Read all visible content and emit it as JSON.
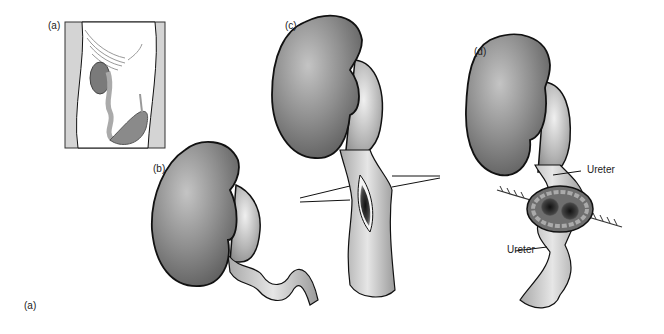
{
  "figure": {
    "panels": [
      {
        "id": "a",
        "label": "(a)",
        "description": "Body inset showing kidney and ureter position"
      },
      {
        "id": "b",
        "label": "(b)",
        "description": "Kidney with tortuous ureter"
      },
      {
        "id": "c",
        "label": "(c)",
        "description": "Kidney with incised ureter held by retractors"
      },
      {
        "id": "d",
        "label": "(d)",
        "description": "Kidney with sutured ureteral anastomosis"
      }
    ],
    "annotations": {
      "ureter_upper": "Ureter",
      "ureter_lower": "Ureter"
    },
    "caption_label": "(a)"
  },
  "colors": {
    "organ_fill": "#8a8a8a",
    "organ_light": "#c8c8c8",
    "ureter_fill": "#b8b8b8",
    "outline": "#111111",
    "inset_bg": "#d4d4d4"
  }
}
